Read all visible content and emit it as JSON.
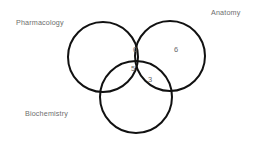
{
  "diagram": {
    "type": "venn-3-set",
    "title": "",
    "background_color": "#ffffff",
    "stroke_color": "#111111",
    "stroke_width": 2,
    "label_color": "#6e6e6e",
    "count_color": "#6a6a6a",
    "sets": [
      {
        "id": "pharmacology",
        "label": "Pharmacology",
        "label_position": "top-left",
        "cx": 103,
        "cy": 57,
        "r": 35
      },
      {
        "id": "anatomy",
        "label": "Anatomy",
        "label_position": "top-right",
        "cx": 170,
        "cy": 56,
        "r": 35
      },
      {
        "id": "biochemistry",
        "label": "Biochemistry",
        "label_position": "bottom-left",
        "cx": 136,
        "cy": 97,
        "r": 36
      }
    ],
    "regions": [
      {
        "id": "pharmacology-anatomy",
        "sets": [
          "pharmacology",
          "anatomy"
        ],
        "value": "0"
      },
      {
        "id": "anatomy-only",
        "sets": [
          "anatomy"
        ],
        "value": "6"
      },
      {
        "id": "pharmacology-anatomy-biochemistry",
        "sets": [
          "pharmacology",
          "anatomy",
          "biochemistry"
        ],
        "value": "5"
      },
      {
        "id": "anatomy-biochemistry",
        "sets": [
          "anatomy",
          "biochemistry"
        ],
        "value": "3"
      }
    ]
  }
}
